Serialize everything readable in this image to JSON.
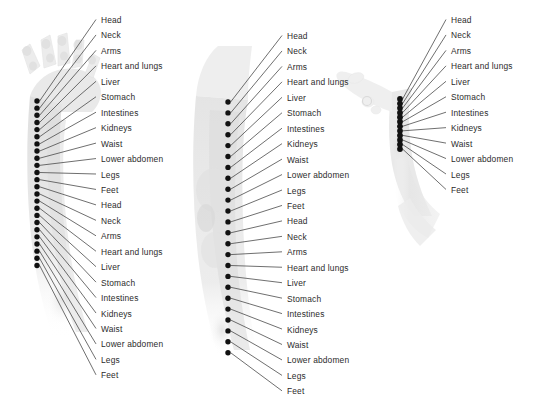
{
  "diagram": {
    "background_color": "#ffffff",
    "marker_color": "#111111",
    "leader_line_color": "#4a4a4a",
    "label_color": "#2b2b2b",
    "xray_tint": "#e9e9e9",
    "zone_names": [
      "Head",
      "Neck",
      "Arms",
      "Heart and lungs",
      "Liver",
      "Stomach",
      "Intestines",
      "Kidneys",
      "Waist",
      "Lower abdomen",
      "Legs",
      "Feet"
    ],
    "panels": [
      {
        "id": "panel-forearm-hand",
        "name": "forearm-and-hand-xray",
        "anatomy": "hand and forearm",
        "marker_count": 24,
        "sequence_repeats": 2,
        "marker_x": 37,
        "marker_top_y": 101,
        "marker_spacing": 7.15,
        "label_x": 101,
        "label_top_y": 15,
        "label_spacing": 15.45,
        "leader_x": 96,
        "labels": [
          "Head",
          "Neck",
          "Arms",
          "Heart and lungs",
          "Liver",
          "Stomach",
          "Intestines",
          "Kidneys",
          "Waist",
          "Lower abdomen",
          "Legs",
          "Feet",
          "Head",
          "Neck",
          "Arms",
          "Heart and lungs",
          "Liver",
          "Stomach",
          "Intestines",
          "Kidneys",
          "Waist",
          "Lower abdomen",
          "Legs",
          "Feet"
        ]
      },
      {
        "id": "panel-knee-leg",
        "name": "knee-and-leg-xray",
        "anatomy": "knee and lower leg",
        "marker_count": 24,
        "sequence_repeats": 2,
        "marker_x": 228,
        "marker_top_y": 102,
        "marker_spacing": 10.9,
        "label_x": 287,
        "label_top_y": 31,
        "label_spacing": 15.45,
        "leader_x": 282,
        "labels": [
          "Head",
          "Neck",
          "Arms",
          "Heart and lungs",
          "Liver",
          "Stomach",
          "Intestines",
          "Kidneys",
          "Waist",
          "Lower abdomen",
          "Legs",
          "Feet",
          "Head",
          "Neck",
          "Arms",
          "Heart and lungs",
          "Liver",
          "Stomach",
          "Intestines",
          "Kidneys",
          "Waist",
          "Lower abdomen",
          "Legs",
          "Feet"
        ]
      },
      {
        "id": "panel-foot",
        "name": "foot-and-ankle-xray",
        "anatomy": "foot and ankle",
        "marker_count": 12,
        "sequence_repeats": 1,
        "marker_x": 400,
        "marker_top_y": 99,
        "marker_spacing": 4.55,
        "label_x": 451,
        "label_top_y": 15,
        "label_spacing": 15.45,
        "leader_x": 446,
        "labels": [
          "Head",
          "Neck",
          "Arms",
          "Heart and lungs",
          "Liver",
          "Stomach",
          "Intestines",
          "Kidneys",
          "Waist",
          "Lower abdomen",
          "Legs",
          "Feet"
        ]
      }
    ]
  }
}
